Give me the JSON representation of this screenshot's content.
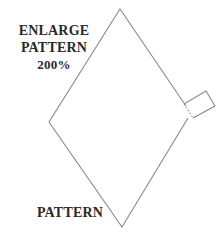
{
  "diagram": {
    "instruction_label": {
      "line1": "ENLARGE",
      "line2": "PATTERN",
      "line3": "200%"
    },
    "shape_label": "PATTERN",
    "shape": {
      "type": "diamond-with-tab",
      "stroke_color": "#8a8a8a",
      "fill_color": "#ffffff",
      "tab_fold_line": "dotted"
    }
  }
}
